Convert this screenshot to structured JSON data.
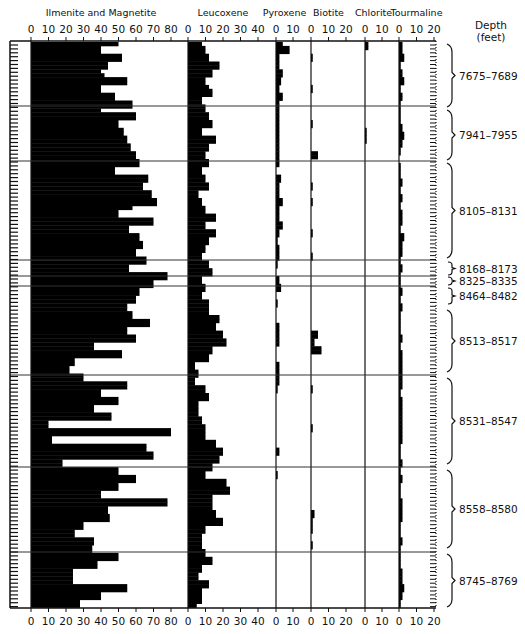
{
  "chart_data": {
    "type": "bar",
    "orientation": "horizontal",
    "title": "",
    "ylabel": "Depth (feet)",
    "layout": {
      "plot_top": 41,
      "plot_bottom": 608,
      "tick_strip_left": 10,
      "tick_strip_right": 31,
      "grid": false,
      "legend": "none"
    },
    "panels": [
      {
        "name": "Ilmenite and Magnetite",
        "x0": 31,
        "xmax_px": 171,
        "max": 80,
        "ticks": [
          0,
          10,
          20,
          30,
          40,
          50,
          60,
          70,
          80
        ]
      },
      {
        "name": "Leucoxene",
        "x0": 188,
        "xmax_px": 258,
        "max": 40,
        "ticks": [
          0,
          10,
          20,
          30,
          40
        ]
      },
      {
        "name": "Pyroxene",
        "x0": 276,
        "xmax_px": 293,
        "max": 10,
        "ticks": [
          0,
          10
        ]
      },
      {
        "name": "Biotite",
        "x0": 311,
        "xmax_px": 346,
        "max": 20,
        "ticks": [
          0,
          10,
          20
        ]
      },
      {
        "name": "Chlorite",
        "x0": 365,
        "xmax_px": 382,
        "max": 10,
        "ticks": [
          0,
          10
        ]
      },
      {
        "name": "Tourmaline",
        "x0": 399,
        "xmax_px": 434,
        "max": 20,
        "ticks": [
          0,
          10,
          20
        ]
      }
    ],
    "depth_intervals": [
      {
        "label": "7675–7689",
        "y_top": 44,
        "y_bottom": 107
      },
      {
        "label": "7941–7955",
        "y_top": 110,
        "y_bottom": 160
      },
      {
        "label": "8105–8131",
        "y_top": 163,
        "y_bottom": 258
      },
      {
        "label": "8168–8173",
        "y_top": 262,
        "y_bottom": 275
      },
      {
        "label": "8325–8335",
        "y_top": 277,
        "y_bottom": 285
      },
      {
        "label": "8464–8482",
        "y_top": 288,
        "y_bottom": 304
      },
      {
        "label": "8513–8517",
        "y_top": 310,
        "y_bottom": 372
      },
      {
        "label": "8531–8547",
        "y_top": 378,
        "y_bottom": 464
      },
      {
        "label": "8558–8580",
        "y_top": 470,
        "y_bottom": 548
      },
      {
        "label": "8745–8769",
        "y_top": 554,
        "y_bottom": 607
      }
    ],
    "separators_y": [
      106,
      161,
      260,
      276,
      286,
      375,
      467,
      552
    ],
    "row_height": 3.9,
    "series": [
      {
        "name": "Ilmenite and Magnetite",
        "values": [
          50,
          40,
          40,
          52,
          52,
          44,
          44,
          40,
          42,
          55,
          55,
          40,
          40,
          48,
          48,
          58,
          58,
          40,
          60,
          60,
          50,
          50,
          53,
          53,
          55,
          55,
          57,
          57,
          60,
          60,
          62,
          62,
          48,
          48,
          67,
          67,
          64,
          64,
          69,
          69,
          72,
          72,
          58,
          50,
          50,
          70,
          70,
          56,
          56,
          62,
          62,
          64,
          64,
          60,
          60,
          66,
          66,
          56,
          56,
          78,
          78,
          70,
          70,
          62,
          62,
          60,
          60,
          55,
          55,
          58,
          58,
          68,
          68,
          55,
          55,
          60,
          60,
          36,
          36,
          52,
          52,
          25,
          25,
          22,
          22,
          30,
          30,
          55,
          55,
          40,
          40,
          50,
          50,
          36,
          36,
          46,
          46,
          10,
          10,
          80,
          80,
          12,
          12,
          66,
          66,
          70,
          70,
          18,
          18,
          50,
          50,
          60,
          60,
          50,
          50,
          40,
          40,
          78,
          78,
          44,
          44,
          45,
          45,
          30,
          30,
          25,
          25,
          36,
          36,
          35,
          35,
          50,
          50,
          38,
          38,
          24,
          24,
          24,
          24,
          55,
          55,
          40,
          40,
          28,
          28,
          50,
          50,
          14,
          14,
          44,
          44,
          44,
          44,
          30,
          30,
          40,
          40,
          48,
          48,
          28,
          28,
          22,
          22,
          14,
          14,
          70,
          70,
          60,
          60,
          45,
          45,
          40,
          40,
          40,
          40,
          35,
          35,
          38,
          38,
          36,
          36,
          32,
          32
        ]
      },
      {
        "name": "Leucoxene",
        "values": [
          8,
          10,
          10,
          12,
          12,
          18,
          18,
          14,
          14,
          10,
          10,
          12,
          14,
          14,
          8,
          8,
          10,
          10,
          12,
          12,
          14,
          14,
          8,
          8,
          16,
          16,
          12,
          12,
          10,
          10,
          12,
          12,
          8,
          8,
          10,
          10,
          12,
          12,
          6,
          6,
          8,
          8,
          10,
          10,
          16,
          16,
          10,
          10,
          16,
          16,
          12,
          12,
          10,
          10,
          8,
          8,
          12,
          12,
          14,
          14,
          8,
          8,
          10,
          10,
          8,
          8,
          12,
          12,
          12,
          12,
          18,
          18,
          16,
          16,
          20,
          20,
          22,
          22,
          14,
          14,
          12,
          12,
          4,
          4,
          6,
          6,
          4,
          4,
          10,
          10,
          12,
          12,
          6,
          6,
          6,
          6,
          8,
          8,
          10,
          10,
          10,
          10,
          16,
          16,
          20,
          20,
          18,
          18,
          14,
          14,
          10,
          10,
          22,
          22,
          24,
          24,
          14,
          14,
          14,
          14,
          16,
          16,
          20,
          20,
          10,
          10,
          8,
          8,
          8,
          8,
          10,
          10,
          14,
          14,
          8,
          8,
          6,
          6,
          12,
          12,
          8,
          8,
          8,
          8,
          5,
          5,
          10,
          10,
          4,
          4,
          6,
          6,
          8,
          8,
          6,
          6,
          8,
          8,
          4,
          4,
          6,
          6,
          16,
          16
        ]
      },
      {
        "name": "Pyroxene",
        "values": [
          4,
          8,
          8,
          2,
          2,
          2,
          2,
          4,
          4,
          3,
          3,
          2,
          2,
          4,
          4,
          2,
          2,
          2,
          2,
          2,
          2,
          2,
          2,
          2,
          2,
          2,
          2,
          2,
          2,
          2,
          2,
          2,
          0,
          0,
          3,
          3,
          2,
          2,
          2,
          2,
          4,
          4,
          2,
          2,
          2,
          2,
          4,
          4,
          2,
          2,
          1,
          1,
          2,
          2,
          2,
          2,
          1,
          1,
          0,
          0,
          2,
          2,
          3,
          3,
          0,
          0,
          1,
          1,
          0,
          0,
          0,
          0,
          2,
          2,
          2,
          2,
          2,
          2,
          0,
          0,
          0,
          0,
          2,
          2,
          2,
          2,
          2,
          2,
          1,
          1,
          0,
          0,
          0,
          0,
          0,
          0,
          0,
          0,
          0,
          0,
          0,
          0,
          0,
          0,
          2,
          2,
          0,
          0,
          0,
          0,
          1,
          1,
          0,
          0,
          0,
          0,
          0,
          0,
          0,
          0,
          0,
          0,
          0,
          0,
          0,
          0,
          0,
          0,
          0,
          0,
          0,
          0,
          0,
          0,
          0,
          0,
          0,
          0,
          0,
          0,
          0,
          0,
          0,
          0,
          0,
          0,
          0,
          0,
          0,
          0,
          0,
          0,
          0,
          0,
          0,
          0,
          0,
          0,
          0,
          0,
          0,
          0,
          0,
          0,
          0,
          0,
          0,
          0,
          0,
          0,
          0,
          0,
          0,
          0,
          1,
          1,
          0,
          0,
          0,
          0
        ]
      },
      {
        "name": "Biotite",
        "values": [
          0,
          0,
          0,
          1,
          1,
          0,
          0,
          0,
          0,
          0,
          0,
          1,
          1,
          0,
          0,
          0,
          0,
          0,
          0,
          0,
          1,
          1,
          0,
          0,
          0,
          0,
          0,
          0,
          4,
          4,
          0,
          0,
          0,
          0,
          0,
          0,
          1,
          1,
          0,
          0,
          1,
          1,
          0,
          0,
          0,
          0,
          0,
          0,
          1,
          1,
          0,
          0,
          0,
          0,
          1,
          1,
          0,
          0,
          0,
          0,
          0,
          0,
          0,
          0,
          0,
          0,
          0,
          0,
          0,
          0,
          0,
          0,
          0,
          0,
          4,
          4,
          2,
          2,
          6,
          6,
          0,
          0,
          0,
          0,
          0,
          0,
          0,
          0,
          1,
          1,
          0,
          0,
          0,
          0,
          0,
          0,
          0,
          0,
          1,
          1,
          0,
          0,
          0,
          0,
          0,
          0,
          0,
          0,
          0,
          0,
          0,
          0,
          0,
          0,
          0,
          0,
          0,
          0,
          0,
          0,
          2,
          2,
          1,
          1,
          1,
          1,
          0,
          0,
          1,
          1,
          0,
          0,
          0,
          0,
          0,
          0,
          0,
          0,
          0,
          0,
          0,
          0,
          0,
          0,
          0,
          0,
          0,
          0,
          0,
          0,
          0,
          0,
          0,
          0,
          0,
          0,
          0,
          0,
          0,
          0,
          0,
          0,
          0,
          0,
          0,
          0,
          0,
          0,
          0,
          0,
          0,
          0,
          0,
          0,
          0,
          0,
          0,
          0,
          0,
          0,
          0,
          0,
          0,
          0
        ]
      },
      {
        "name": "Chlorite",
        "values": [
          2,
          2,
          0,
          0,
          0,
          0,
          0,
          0,
          0,
          0,
          0,
          0,
          0,
          0,
          0,
          0,
          0,
          0,
          0,
          0,
          0,
          0,
          1,
          1,
          1,
          1,
          0,
          0,
          0,
          0,
          0,
          0,
          0,
          0,
          0,
          0,
          0,
          0,
          0,
          0,
          0,
          0,
          0,
          0,
          0,
          0,
          0,
          0,
          0,
          0,
          0,
          0,
          0,
          0,
          0,
          0,
          0,
          0,
          0,
          0,
          0,
          0,
          0,
          0,
          0,
          0,
          0,
          0,
          0,
          0,
          0,
          0,
          0,
          0,
          0,
          0,
          0,
          0,
          0,
          0,
          0,
          0,
          0,
          0,
          0,
          0,
          0,
          0,
          0,
          0,
          0,
          0,
          0,
          0,
          0,
          0,
          0,
          0,
          0,
          0,
          0,
          0,
          0,
          0,
          0,
          0,
          0,
          0,
          0,
          0,
          0,
          0,
          0,
          0,
          0,
          0,
          0,
          0,
          0,
          0,
          0,
          0,
          0,
          0,
          0,
          0,
          0,
          0,
          0,
          0,
          0,
          0,
          0,
          0,
          0,
          0,
          0,
          0,
          0,
          0,
          0,
          0,
          0,
          0,
          0,
          0,
          0,
          0,
          0,
          0,
          0,
          0,
          0,
          0,
          0,
          0,
          0,
          0,
          0,
          0,
          0,
          0,
          0,
          0,
          0,
          0,
          0,
          0,
          0,
          0,
          0,
          0,
          0,
          0,
          0,
          0,
          0,
          0,
          0,
          0,
          0,
          0,
          0,
          0
        ]
      },
      {
        "name": "Tourmaline",
        "values": [
          2,
          2,
          2,
          3,
          3,
          1,
          1,
          2,
          2,
          3,
          3,
          1,
          1,
          2,
          2,
          1,
          1,
          1,
          1,
          1,
          1,
          2,
          2,
          3,
          3,
          2,
          2,
          1,
          1,
          0,
          0,
          1,
          1,
          1,
          1,
          2,
          2,
          1,
          1,
          2,
          2,
          1,
          1,
          2,
          2,
          2,
          2,
          1,
          1,
          3,
          3,
          2,
          2,
          2,
          2,
          1,
          1,
          2,
          2,
          1,
          1,
          1,
          1,
          2,
          2,
          1,
          1,
          2,
          2,
          1,
          1,
          1,
          1,
          1,
          1,
          2,
          2,
          1,
          1,
          2,
          2,
          2,
          2,
          2,
          2,
          2,
          2,
          2,
          2,
          1,
          1,
          2,
          2,
          2,
          2,
          2,
          2,
          2,
          2,
          2,
          2,
          2,
          2,
          1,
          1,
          1,
          1,
          2,
          2,
          1,
          1,
          2,
          2,
          1,
          1,
          1,
          1,
          2,
          2,
          2,
          2,
          2,
          2,
          1,
          1,
          1,
          1,
          2,
          2,
          1,
          1,
          1,
          1,
          1,
          1,
          2,
          2,
          2,
          2,
          3,
          3,
          2,
          2,
          1,
          1,
          3,
          3,
          2,
          2,
          3,
          3,
          2,
          2,
          3,
          3,
          1,
          1,
          1,
          1,
          2,
          2,
          1,
          1,
          0,
          0,
          0,
          0,
          1,
          1,
          0,
          0,
          0,
          0,
          1,
          1,
          0,
          0,
          0,
          0,
          0,
          0,
          0,
          0,
          0,
          0
        ]
      }
    ]
  }
}
